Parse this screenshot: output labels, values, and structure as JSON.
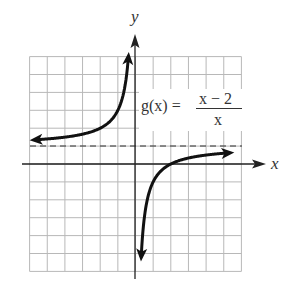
{
  "chart_data": {
    "type": "line",
    "title": "",
    "function_label": {
      "name": "g(x) =",
      "numerator": "x − 2",
      "denominator": "x"
    },
    "xlabel": "x",
    "ylabel": "y",
    "xlim": [
      -6,
      6
    ],
    "ylim": [
      -6,
      6
    ],
    "grid": true,
    "grid_step": 1,
    "asymptotes": {
      "horizontal": [
        {
          "y": 1,
          "style": "dashed"
        }
      ],
      "vertical": [
        {
          "x": 0,
          "note": "coincides with y-axis"
        }
      ]
    },
    "series": [
      {
        "name": "g(x) left branch",
        "x": [
          -6,
          -5,
          -4,
          -3,
          -2,
          -1.5,
          -1,
          -0.75,
          -0.5,
          -0.4
        ],
        "y": [
          1.33,
          1.4,
          1.5,
          1.67,
          2,
          2.33,
          3,
          3.67,
          5,
          6
        ]
      },
      {
        "name": "g(x) right branch",
        "x": [
          0.29,
          0.35,
          0.5,
          0.75,
          1,
          1.5,
          2,
          3,
          4,
          5,
          5.6
        ],
        "y": [
          -6,
          -4.7,
          -3,
          -1.67,
          -1,
          -0.33,
          0,
          0.33,
          0.5,
          0.6,
          0.64
        ]
      }
    ],
    "key_points": [
      {
        "x": 2,
        "y": 0,
        "label": "x-intercept"
      }
    ]
  },
  "labels": {
    "x_axis": "x",
    "y_axis": "y",
    "func_name": "g(x) =",
    "numerator": "x − 2",
    "denominator": "x"
  }
}
